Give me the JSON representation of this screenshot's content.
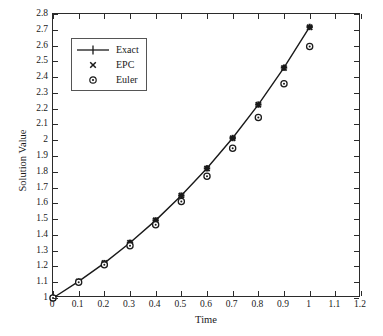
{
  "chart_data": {
    "type": "line",
    "title": "",
    "xlabel": "Time",
    "ylabel": "Solution Value",
    "xlim": [
      0,
      1.2
    ],
    "ylim": [
      1,
      2.8
    ],
    "grid": false,
    "legend_position": "upper-left",
    "xticks": [
      "0",
      "0.1",
      "0.2",
      "0.3",
      "0.4",
      "0.5",
      "0.6",
      "0.7",
      "0.8",
      "0.9",
      "1",
      "1.1",
      "1.2"
    ],
    "xtick_values": [
      0,
      0.1,
      0.2,
      0.3,
      0.4,
      0.5,
      0.6,
      0.7,
      0.8,
      0.9,
      1.0,
      1.1,
      1.2
    ],
    "yticks": [
      "1",
      "1.1",
      "1.2",
      "1.3",
      "1.4",
      "1.5",
      "1.6",
      "1.7",
      "1.8",
      "1.9",
      "2",
      "2.1",
      "2.2",
      "2.3",
      "2.4",
      "2.5",
      "2.6",
      "2.7",
      "2.8"
    ],
    "ytick_values": [
      1,
      1.1,
      1.2,
      1.3,
      1.4,
      1.5,
      1.6,
      1.7,
      1.8,
      1.9,
      2,
      2.1,
      2.2,
      2.3,
      2.4,
      2.5,
      2.6,
      2.7,
      2.8
    ],
    "x": [
      0,
      0.1,
      0.2,
      0.3,
      0.4,
      0.5,
      0.6,
      0.7,
      0.8,
      0.9,
      1.0
    ],
    "series": [
      {
        "name": "Exact",
        "marker": "plus",
        "line": "solid",
        "color": "#1a1a1a",
        "values": [
          1.0,
          1.105,
          1.221,
          1.35,
          1.492,
          1.649,
          1.822,
          2.014,
          2.226,
          2.46,
          2.718
        ]
      },
      {
        "name": "EPC",
        "marker": "cross",
        "line": "none",
        "color": "#1a1a1a",
        "values": [
          1.0,
          1.105,
          1.221,
          1.35,
          1.492,
          1.649,
          1.821,
          2.013,
          2.225,
          2.458,
          2.716
        ]
      },
      {
        "name": "Euler",
        "marker": "circle",
        "line": "none",
        "color": "#1a1a1a",
        "values": [
          1.0,
          1.1,
          1.21,
          1.331,
          1.464,
          1.611,
          1.772,
          1.949,
          2.144,
          2.358,
          2.594
        ]
      }
    ]
  },
  "legend": {
    "entries": [
      {
        "label": "Exact"
      },
      {
        "label": "EPC"
      },
      {
        "label": "Euler"
      }
    ]
  },
  "axes": {
    "x_title": "Time",
    "y_title": "Solution Value"
  }
}
